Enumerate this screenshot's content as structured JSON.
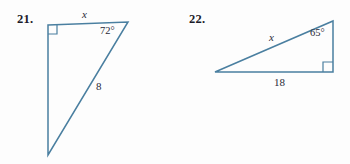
{
  "page": {
    "background_color": "#fdfdfd",
    "figure_stroke_color": "#4a7fa0",
    "label_color": "#2a2a38",
    "number_color": "#1b1b28"
  },
  "problems": [
    {
      "number": "21.",
      "shape": "right-triangle",
      "orientation": "right angle at top-left, vertical leg on left, hypotenuse from top-right down to bottom",
      "labels": {
        "unknown_side": "x",
        "unknown_side_position": "top",
        "angle": "72°",
        "angle_position": "top-right vertex",
        "known_side": "8",
        "known_side_position": "hypotenuse",
        "right_angle_marker": "square"
      },
      "geometry": {
        "vertices": [
          {
            "name": "top-left",
            "x": 48,
            "y": 25
          },
          {
            "name": "top-right",
            "x": 128,
            "y": 22
          },
          {
            "name": "bottom",
            "x": 48,
            "y": 155
          }
        ],
        "right_angle_square": {
          "x": 48,
          "y": 25,
          "size": 9
        }
      }
    },
    {
      "number": "22.",
      "shape": "right-triangle",
      "orientation": "right angle at bottom-right, horizontal base, hypotenuse from left vertex up to top-right",
      "labels": {
        "unknown_side": "x",
        "unknown_side_position": "hypotenuse",
        "angle": "65°",
        "angle_position": "top-right vertex",
        "known_side": "18",
        "known_side_position": "base",
        "right_angle_marker": "square"
      },
      "geometry": {
        "vertices": [
          {
            "name": "left",
            "x": 215,
            "y": 72
          },
          {
            "name": "top-right",
            "x": 333,
            "y": 21
          },
          {
            "name": "bottom-right",
            "x": 333,
            "y": 72
          }
        ],
        "right_angle_square": {
          "x": 323,
          "y": 62,
          "size": 10
        }
      }
    }
  ]
}
